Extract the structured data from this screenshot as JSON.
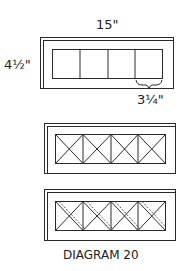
{
  "diagram": {
    "caption": "DIAGRAM 20",
    "dimensions": {
      "width": "15\"",
      "height": "4½\"",
      "pane_width": "3¼\""
    },
    "figures": [
      {
        "name": "frame-plain",
        "panes": 4,
        "pattern": "empty"
      },
      {
        "name": "frame-x-cross",
        "panes": 4,
        "pattern": "x-cross"
      },
      {
        "name": "frame-x-cross-double",
        "panes": 4,
        "pattern": "x-cross-double-diagonal"
      }
    ],
    "colors": {
      "line": "#2a2a2a",
      "background": "#ffffff"
    }
  }
}
